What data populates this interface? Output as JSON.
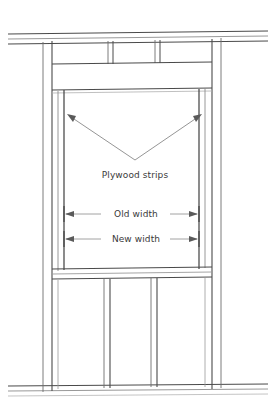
{
  "diagram": {
    "background_color": "#ffffff",
    "line_color": "#4a4a4a",
    "line_color_light": "#9a9a9a",
    "text_color": "#3a3a3a",
    "width": 275,
    "height": 411
  },
  "labels": {
    "plywood_strips": "Plywood strips",
    "old_width": "Old width",
    "new_width": "New width"
  },
  "annotations": {
    "plywood_leader": {
      "name": "plywood-strips-leader",
      "apex_x": 135,
      "apex_y": 160,
      "left_tip_x": 70,
      "left_tip_y": 116,
      "right_tip_x": 199,
      "right_tip_y": 116
    },
    "old_width_dimension": {
      "name": "old-width-dimension",
      "left_x": 64,
      "right_x": 191,
      "y": 214,
      "label_gap_left": 103,
      "label_gap_right": 168
    },
    "new_width_dimension": {
      "name": "new-width-dimension",
      "left_x": 64,
      "right_x": 191,
      "y": 239,
      "label_gap_left": 103,
      "label_gap_right": 168
    }
  },
  "structure": {
    "top_plate": {
      "name": "top-plate",
      "lines_y": [
        31,
        36,
        41
      ],
      "x_start": 8,
      "x_end": 268,
      "skew": -3
    },
    "bottom_plate": {
      "name": "bottom-plate",
      "lines_y": [
        384,
        389,
        394
      ],
      "x_start": 8,
      "x_end": 268,
      "skew": -2
    },
    "king_studs": [
      {
        "name": "king-stud-left-outer",
        "x": 43,
        "y_top": 41,
        "y_bottom": 391
      },
      {
        "name": "king-stud-left-inner",
        "x": 52,
        "y_top": 41,
        "y_bottom": 391
      },
      {
        "name": "king-stud-right-inner",
        "x": 212,
        "y_top": 38,
        "y_bottom": 388
      },
      {
        "name": "king-stud-right-outer",
        "x": 221,
        "y_top": 38,
        "y_bottom": 388
      }
    ],
    "header_band": {
      "name": "window-header",
      "y_top": 62,
      "y_bottom": 88,
      "x_left": 52,
      "x_right": 212
    },
    "sill_band": {
      "name": "window-sill",
      "y_top": 267,
      "y_bottom": 277,
      "x_left": 52,
      "x_right": 212
    },
    "opening": {
      "name": "rough-opening",
      "x_left": 64,
      "x_right": 199,
      "y_top": 92,
      "y_bottom": 267
    },
    "plywood_strips": [
      {
        "name": "plywood-strip-left",
        "x_outer": 58,
        "x_inner": 64,
        "y_top": 90,
        "y_bottom": 270
      },
      {
        "name": "plywood-strip-right",
        "x_outer": 205,
        "x_inner": 199,
        "y_top": 88,
        "y_bottom": 268
      }
    ],
    "top_cripples": [
      {
        "name": "cripple-stud-top-1",
        "x": 108,
        "y_top": 40,
        "y_bottom": 64
      },
      {
        "name": "cripple-stud-top-2",
        "x": 113,
        "y_top": 40,
        "y_bottom": 64
      },
      {
        "name": "cripple-stud-top-3",
        "x": 155,
        "y_top": 39,
        "y_bottom": 63
      },
      {
        "name": "cripple-stud-top-4",
        "x": 160,
        "y_top": 39,
        "y_bottom": 63
      }
    ],
    "bottom_cripples": [
      {
        "name": "cripple-stud-bottom-1",
        "x": 104,
        "y_top": 277,
        "y_bottom": 387
      },
      {
        "name": "cripple-stud-bottom-2",
        "x": 110,
        "y_top": 277,
        "y_bottom": 387
      },
      {
        "name": "cripple-stud-bottom-3",
        "x": 151,
        "y_top": 276,
        "y_bottom": 386
      },
      {
        "name": "cripple-stud-bottom-4",
        "x": 157,
        "y_top": 276,
        "y_bottom": 386
      }
    ]
  }
}
